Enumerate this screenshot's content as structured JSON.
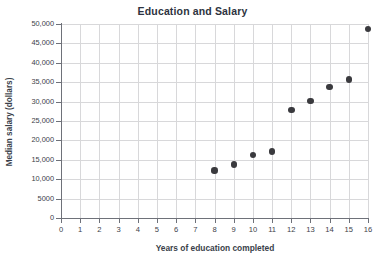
{
  "chart_data": {
    "type": "scatter",
    "title": "Education and Salary",
    "xlabel": "Years of education completed",
    "ylabel": "Median salary (dollars)",
    "xlim": [
      0,
      16
    ],
    "ylim": [
      0,
      50000
    ],
    "grid": true,
    "legend": null,
    "x_ticks": [
      0,
      1,
      2,
      3,
      4,
      5,
      6,
      7,
      8,
      9,
      10,
      11,
      12,
      13,
      14,
      15,
      16
    ],
    "x_tick_labels": [
      "0",
      "1",
      "2",
      "3",
      "4",
      "5",
      "6",
      "7",
      "8",
      "9",
      "10",
      "11",
      "12",
      "13",
      "14",
      "15",
      "16"
    ],
    "y_ticks": [
      0,
      5000,
      10000,
      15000,
      20000,
      25000,
      30000,
      35000,
      40000,
      45000,
      50000
    ],
    "y_tick_labels": [
      "0",
      "5000",
      "10,000",
      "15,000",
      "20,000",
      "25,000",
      "30,000",
      "35,000",
      "40,000",
      "45,000",
      "50,000"
    ],
    "x": [
      8,
      9,
      10,
      11,
      12,
      13,
      14,
      15,
      16
    ],
    "y": [
      12300,
      13800,
      16300,
      17200,
      27800,
      30200,
      33800,
      35700,
      48700
    ],
    "points": [
      {
        "x": 8,
        "y": 12300
      },
      {
        "x": 9,
        "y": 13800
      },
      {
        "x": 10,
        "y": 16300
      },
      {
        "x": 11,
        "y": 17200
      },
      {
        "x": 12,
        "y": 27800
      },
      {
        "x": 13,
        "y": 30200
      },
      {
        "x": 14,
        "y": 33800
      },
      {
        "x": 15,
        "y": 35700
      },
      {
        "x": 16,
        "y": 48700
      }
    ],
    "marker_color": "#3a3a3e",
    "grid_color": "#d8d8da",
    "axis_color": "#6e7179",
    "title_color": "#2d3340",
    "background": "#ffffff"
  }
}
